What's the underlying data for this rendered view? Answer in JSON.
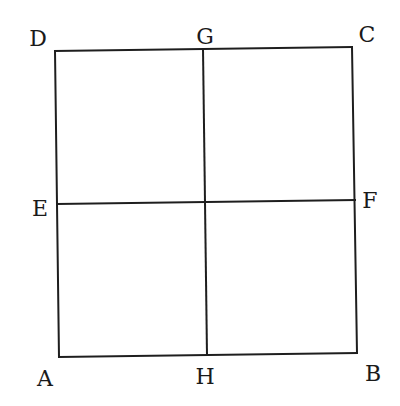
{
  "diagram": {
    "type": "square-divided-into-four",
    "points": {
      "A": {
        "label": "A",
        "x": 59,
        "y": 357,
        "lx": 45,
        "ly": 386
      },
      "B": {
        "label": "B",
        "x": 357,
        "y": 353,
        "lx": 373,
        "ly": 381
      },
      "C": {
        "label": "C",
        "x": 352,
        "y": 47,
        "lx": 367,
        "ly": 42
      },
      "D": {
        "label": "D",
        "x": 55,
        "y": 51,
        "lx": 38,
        "ly": 46
      },
      "E": {
        "label": "E",
        "x": 57,
        "y": 204,
        "lx": 40,
        "ly": 216
      },
      "F": {
        "label": "F",
        "x": 355,
        "y": 200,
        "lx": 370,
        "ly": 208
      },
      "G": {
        "label": "G",
        "x": 203,
        "y": 49,
        "lx": 205,
        "ly": 44
      },
      "H": {
        "label": "H",
        "x": 207,
        "y": 355,
        "lx": 205,
        "ly": 384
      }
    },
    "segments": [
      [
        "A",
        "B"
      ],
      [
        "B",
        "C"
      ],
      [
        "C",
        "D"
      ],
      [
        "D",
        "A"
      ],
      [
        "E",
        "F"
      ],
      [
        "G",
        "H"
      ]
    ],
    "colors": {
      "stroke": "#1e1e1e",
      "text": "#1a1a1a",
      "background": "#ffffff"
    }
  }
}
